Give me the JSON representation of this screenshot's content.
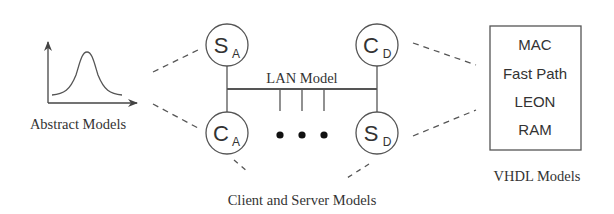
{
  "diagram": {
    "abstract_models": {
      "label": "Abstract Models",
      "icon": "gaussian-curve-plot"
    },
    "client_server": {
      "label": "Client and Server Models",
      "lan_label": "LAN Model",
      "ellipsis": "• • •",
      "nodes": [
        {
          "main": "S",
          "sub": "A"
        },
        {
          "main": "C",
          "sub": "D"
        },
        {
          "main": "C",
          "sub": "A"
        },
        {
          "main": "S",
          "sub": "D"
        }
      ]
    },
    "vhdl_models": {
      "label": "VHDL Models",
      "items": [
        "MAC",
        "Fast Path",
        "LEON",
        "RAM"
      ]
    },
    "colors": {
      "stroke": "#555555",
      "text": "#333333",
      "background": "#ffffff"
    }
  }
}
